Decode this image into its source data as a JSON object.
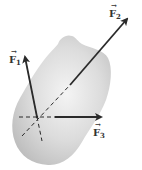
{
  "diagram": {
    "body": {
      "fill": "#d9d9d9",
      "edge": "#f2f2f2"
    },
    "point_of_concurrence": {
      "x": 37,
      "y": 117
    },
    "forces": [
      {
        "id": "F1",
        "label": "F",
        "subscript": "1",
        "vector_mark": "→",
        "color": "#2a2a2a"
      },
      {
        "id": "F2",
        "label": "F",
        "subscript": "2",
        "vector_mark": "→",
        "color": "#2a2a2a"
      },
      {
        "id": "F3",
        "label": "F",
        "subscript": "3",
        "vector_mark": "→",
        "color": "#2a2a2a"
      }
    ],
    "line_style": {
      "lines_of_action": "dashed",
      "vectors": "solid"
    }
  }
}
